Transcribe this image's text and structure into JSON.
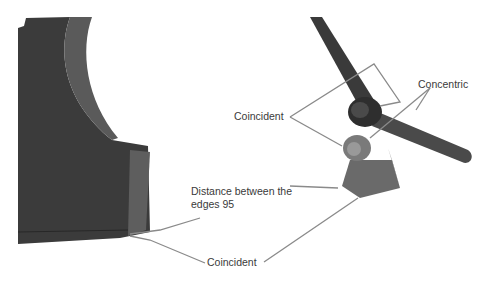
{
  "diagram": {
    "labels": {
      "coincident_top": "Coincident",
      "concentric": "Concentric",
      "distance_line1": "Distance between the",
      "distance_line2": "edges 95",
      "coincident_bottom": "Coincident"
    },
    "colors": {
      "part_dark": "#3c3c3c",
      "part_side": "#5e5e5e",
      "leader": "#8a8a8a",
      "text": "#3a3a3a"
    }
  }
}
